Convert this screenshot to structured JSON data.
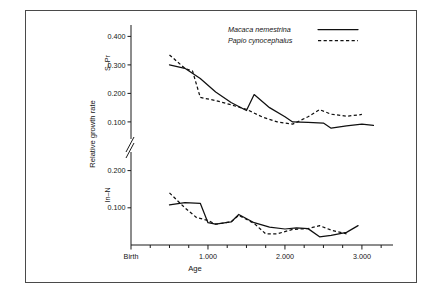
{
  "figure": {
    "border_color": "#4a4a4a",
    "background": "#ffffff",
    "ink_color": "#101010"
  },
  "axis": {
    "ylabel": "Relative growth rate",
    "xlabel": "Age",
    "upper_panel_label": "S–Pr",
    "lower_panel_label": "In–N",
    "upper_ticks": [
      "0.400",
      "0.300",
      "0.200",
      "0.100"
    ],
    "lower_ticks": [
      "0.200",
      "0.100"
    ],
    "x_ticks": [
      "Birth",
      "1.000",
      "2.000",
      "3.000"
    ],
    "break_marker": "//"
  },
  "legend": {
    "position": "top-right",
    "entries": [
      {
        "label": "Macaca nemestrina",
        "style": "solid"
      },
      {
        "label": "Papio cynocephalus",
        "style": "dashed"
      }
    ]
  },
  "chart_data": {
    "type": "line",
    "title": "",
    "subtitle": "",
    "xlabel": "Age",
    "ylabel": "Relative growth rate",
    "grid": false,
    "legend_position": "top-right",
    "axis_break": true,
    "note": "Two stacked panels sharing one broken y-axis: upper panel S-Pr, lower panel In-N. X axis is age in days, 'Birth' = 0.",
    "xlim": [
      0,
      3300
    ],
    "x_tick_values": [
      0,
      1000,
      2000,
      3000
    ],
    "x_tick_labels": [
      "Birth",
      "1.000",
      "2.000",
      "3.000"
    ],
    "panels": [
      {
        "name": "S-Pr",
        "ylabel": "S–Pr",
        "ylim": [
          0.04,
          0.44
        ],
        "y_tick_values": [
          0.4,
          0.3,
          0.2,
          0.1
        ],
        "y_tick_labels": [
          "0.400",
          "0.300",
          "0.200",
          "0.100"
        ],
        "series": [
          {
            "name": "Macaca nemestrina",
            "style": "solid",
            "x": [
              500,
              700,
              900,
              1100,
              1300,
              1500,
              1600,
              1800,
              2000,
              2100,
              2300,
              2500,
              2600,
              2800,
              3000,
              3150
            ],
            "y": [
              0.3,
              0.288,
              0.252,
              0.205,
              0.168,
              0.14,
              0.196,
              0.15,
              0.118,
              0.1,
              0.098,
              0.096,
              0.078,
              0.086,
              0.092,
              0.088
            ]
          },
          {
            "name": "Papio cynocephalus",
            "style": "dashed",
            "x": [
              500,
              700,
              800,
              900,
              1100,
              1300,
              1500,
              1700,
              1900,
              2100,
              2300,
              2450,
              2600,
              2800,
              3000
            ],
            "y": [
              0.335,
              0.288,
              0.278,
              0.186,
              0.175,
              0.16,
              0.144,
              0.118,
              0.1,
              0.092,
              0.118,
              0.143,
              0.127,
              0.12,
              0.126
            ]
          }
        ]
      },
      {
        "name": "In-N",
        "ylabel": "In–N",
        "ylim": [
          0.0,
          0.25
        ],
        "y_tick_values": [
          0.2,
          0.1
        ],
        "y_tick_labels": [
          "0.200",
          "0.100"
        ],
        "series": [
          {
            "name": "Macaca nemestrina",
            "style": "solid",
            "x": [
              500,
              700,
              900,
              1000,
              1100,
              1300,
              1400,
              1600,
              1800,
              2000,
              2150,
              2300,
              2450,
              2600,
              2800,
              2950
            ],
            "y": [
              0.108,
              0.114,
              0.112,
              0.06,
              0.056,
              0.062,
              0.082,
              0.06,
              0.048,
              0.043,
              0.046,
              0.044,
              0.022,
              0.026,
              0.034,
              0.052
            ]
          },
          {
            "name": "Papio cynocephalus",
            "style": "dashed",
            "x": [
              500,
              700,
              850,
              1000,
              1100,
              1300,
              1400,
              1600,
              1750,
              1900,
              2100,
              2300,
              2450,
              2600,
              2800
            ],
            "y": [
              0.14,
              0.1,
              0.074,
              0.066,
              0.056,
              0.062,
              0.08,
              0.058,
              0.03,
              0.03,
              0.042,
              0.044,
              0.052,
              0.04,
              0.03
            ]
          }
        ]
      }
    ]
  }
}
